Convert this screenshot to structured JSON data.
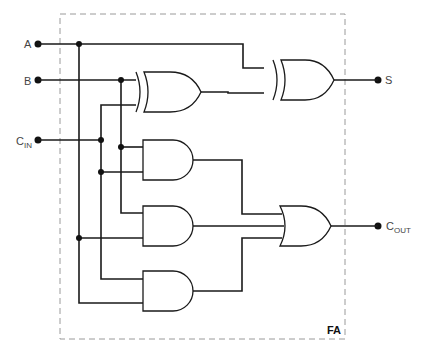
{
  "diagram": {
    "block_label": "FA",
    "inputs": [
      {
        "id": "A",
        "label": "A",
        "sub": ""
      },
      {
        "id": "B",
        "label": "B",
        "sub": ""
      },
      {
        "id": "Cin",
        "label": "C",
        "sub": "IN"
      }
    ],
    "outputs": [
      {
        "id": "S",
        "label": "S",
        "sub": ""
      },
      {
        "id": "Cout",
        "label": "C",
        "sub": "OUT"
      }
    ],
    "gates": [
      {
        "id": "xor1",
        "type": "XOR",
        "inputs": [
          "B",
          "Cin"
        ]
      },
      {
        "id": "xor2",
        "type": "XOR",
        "inputs": [
          "A",
          "xor1"
        ],
        "output": "S"
      },
      {
        "id": "and1",
        "type": "AND",
        "inputs": [
          "B",
          "Cin"
        ]
      },
      {
        "id": "and2",
        "type": "AND",
        "inputs": [
          "B",
          "A"
        ]
      },
      {
        "id": "and3",
        "type": "AND",
        "inputs": [
          "Cin",
          "A"
        ]
      },
      {
        "id": "or1",
        "type": "OR",
        "inputs": [
          "and1",
          "and2",
          "and3"
        ],
        "output": "Cout"
      }
    ],
    "colors": {
      "wire": "#1a1a1a",
      "border": "#9a9a9a"
    }
  }
}
